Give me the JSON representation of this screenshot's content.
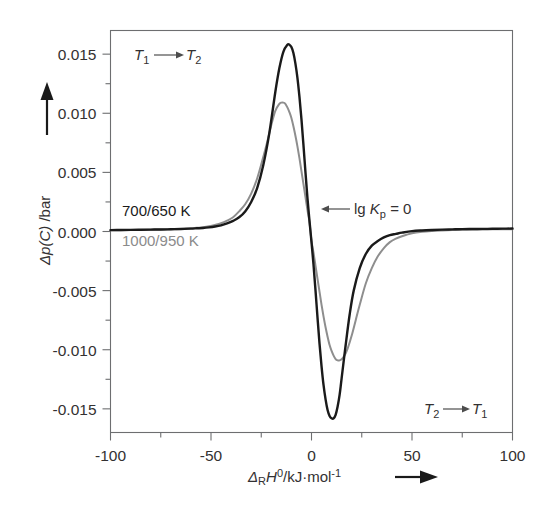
{
  "figure": {
    "background_color": "#ffffff",
    "frame_color": "#6d6e70",
    "text_color": "#333132"
  },
  "axes": {
    "x": {
      "title_parts": {
        "delta": "Δ",
        "sub_r": "R",
        "h": "H",
        "sup_0": "0",
        "units": "/kJ·mol",
        "sup_minus1": "-1"
      },
      "title_plain": "ΔRH0/kJ·mol-1",
      "tick_labels": [
        "-100",
        "-50",
        "0",
        "50",
        "100"
      ],
      "tick_values": [
        -100,
        -50,
        0,
        50,
        100
      ],
      "minor_tick_values": [
        -75,
        -25,
        25,
        75
      ],
      "range": [
        -100,
        100
      ],
      "arrow": "right-arrow"
    },
    "y": {
      "title_parts": {
        "delta_p": "Δp(C)",
        "units": " /bar"
      },
      "title_plain": "Δp(C) /bar",
      "tick_labels": [
        "0.015",
        "0.010",
        "0.005",
        "0.000",
        "-0.005",
        "-0.010",
        "-0.015"
      ],
      "tick_values": [
        0.015,
        0.01,
        0.005,
        0.0,
        -0.005,
        -0.01,
        -0.015
      ],
      "range": [
        -0.017,
        0.017
      ],
      "arrow": "up-arrow"
    }
  },
  "annotations": [
    {
      "id": "transition-forward",
      "text": "T₁ ⟶ T₂",
      "lead": "T",
      "lead_sub": "1",
      "trail": "T",
      "trail_sub": "2",
      "color": "#333132",
      "position": "top-left"
    },
    {
      "id": "series-label-black",
      "text": "700/650 K",
      "color": "#1a1a1a",
      "position": "left-mid"
    },
    {
      "id": "series-label-gray",
      "text": "1000/950 K",
      "color": "#8b8b8b",
      "position": "left-mid-lower"
    },
    {
      "id": "lg-kp-marker",
      "text": "lg Kₚ = 0",
      "lead": "lg ",
      "ital": "K",
      "sub": "p",
      "trail": " = 0",
      "color": "#333132",
      "position": "center-right",
      "arrow": "left-arrow"
    },
    {
      "id": "transition-reverse",
      "text": "T₂ ⟶ T₁",
      "lead": "T",
      "lead_sub": "2",
      "trail": "T",
      "trail_sub": "1",
      "color": "#333132",
      "position": "bottom-right"
    }
  ],
  "chart_data": {
    "type": "line",
    "title": "",
    "subtitle": "",
    "xlabel": "ΔRH⁰/kJ·mol⁻¹",
    "ylabel": "Δp(C)/bar",
    "xlim": [
      -100,
      100
    ],
    "ylim": [
      -0.017,
      0.017
    ],
    "xticks": [
      -100,
      -50,
      0,
      50,
      100
    ],
    "yticks": [
      0.015,
      0.01,
      0.005,
      0.0,
      -0.005,
      -0.01,
      -0.015
    ],
    "grid": false,
    "legend_position": "inside-left",
    "series": [
      {
        "name": "700/650 K",
        "color": "#1a1a1a",
        "peak_x": -11,
        "peak_y": 0.0158,
        "trough_x": 12,
        "trough_y": -0.0155,
        "zero_crossing_x": 0,
        "x": [
          -100,
          -95,
          -90,
          -85,
          -80,
          -75,
          -70,
          -65,
          -60,
          -57,
          -54,
          -51,
          -48,
          -45,
          -42,
          -39,
          -36,
          -33,
          -30,
          -27,
          -24,
          -21,
          -18,
          -16,
          -14,
          -12,
          -11,
          -10,
          -9,
          -8,
          -7,
          -6,
          -5,
          -4,
          -3,
          -2,
          -1,
          0,
          1,
          2,
          3,
          4,
          5,
          6,
          7,
          8,
          9,
          10,
          11,
          12,
          13,
          14,
          15,
          17,
          19,
          21,
          24,
          27,
          30,
          33,
          36,
          39,
          42,
          45,
          50,
          55,
          60,
          65,
          70,
          75,
          80,
          85,
          90,
          95,
          100
        ],
        "y": [
          0.00012,
          0.00013,
          0.00014,
          0.00015,
          0.00016,
          0.00017,
          0.00019,
          0.00021,
          0.00024,
          0.00027,
          0.0003,
          0.00035,
          0.00042,
          0.00052,
          0.00068,
          0.0009,
          0.0012,
          0.0017,
          0.0025,
          0.0037,
          0.0056,
          0.0083,
          0.0118,
          0.0138,
          0.0152,
          0.0158,
          0.0158,
          0.0156,
          0.0151,
          0.0142,
          0.013,
          0.0114,
          0.0095,
          0.0073,
          0.005,
          0.0028,
          0.0009,
          -0.0009,
          -0.0028,
          -0.005,
          -0.0073,
          -0.0095,
          -0.0114,
          -0.013,
          -0.0142,
          -0.0151,
          -0.0156,
          -0.0158,
          -0.0158,
          -0.0155,
          -0.0148,
          -0.0138,
          -0.0124,
          -0.0096,
          -0.007,
          -0.005,
          -0.0031,
          -0.0019,
          -0.0012,
          -0.0008,
          -0.0005,
          -0.0003,
          -0.0002,
          -0.0001,
          3e-05,
          9e-05,
          0.00013,
          0.00016,
          0.00018,
          0.0002,
          0.00021,
          0.00022,
          0.00023,
          0.00024,
          0.00025
        ]
      },
      {
        "name": "1000/950 K",
        "color": "#8e8e8e",
        "peak_x": -14,
        "peak_y": 0.0109,
        "trough_x": 16,
        "trough_y": -0.0109,
        "zero_crossing_x": 0,
        "x": [
          -100,
          -95,
          -90,
          -85,
          -80,
          -75,
          -70,
          -65,
          -60,
          -57,
          -54,
          -51,
          -48,
          -45,
          -42,
          -39,
          -36,
          -33,
          -30,
          -27,
          -24,
          -22,
          -20,
          -18,
          -16,
          -15,
          -14,
          -13,
          -12,
          -11,
          -10,
          -9,
          -8,
          -7,
          -6,
          -5,
          -4,
          -3,
          -2,
          -1,
          0,
          1,
          2,
          3,
          4,
          5,
          6,
          7,
          8,
          9,
          10,
          11,
          12,
          13,
          14,
          15,
          16,
          17,
          18,
          20,
          22,
          24,
          27,
          30,
          33,
          36,
          39,
          42,
          45,
          50,
          55,
          60,
          65,
          70,
          75,
          80,
          85,
          90,
          95,
          100
        ],
        "y": [
          0.0001,
          0.00011,
          0.00012,
          0.00013,
          0.00015,
          0.00017,
          0.00019,
          0.00022,
          0.00027,
          0.00031,
          0.00037,
          0.00045,
          0.00056,
          0.0007,
          0.00092,
          0.0012,
          0.0017,
          0.0023,
          0.0032,
          0.0045,
          0.0063,
          0.0076,
          0.009,
          0.0102,
          0.0108,
          0.0109,
          0.0109,
          0.0108,
          0.0105,
          0.0101,
          0.0096,
          0.0089,
          0.0081,
          0.0072,
          0.0062,
          0.0051,
          0.004,
          0.0029,
          0.0018,
          0.0008,
          -0.0008,
          -0.0018,
          -0.0029,
          -0.004,
          -0.0051,
          -0.0062,
          -0.0072,
          -0.0081,
          -0.0089,
          -0.0096,
          -0.0101,
          -0.0105,
          -0.0108,
          -0.0109,
          -0.0109,
          -0.0108,
          -0.0106,
          -0.0103,
          -0.0099,
          -0.0088,
          -0.0075,
          -0.0062,
          -0.0044,
          -0.0031,
          -0.0021,
          -0.0014,
          -0.0009,
          -0.0006,
          -0.0004,
          -0.00015,
          -2e-05,
          5e-05,
          9e-05,
          0.00012,
          0.00014,
          0.00016,
          0.00017,
          0.00018,
          0.00019,
          0.0002
        ]
      }
    ]
  }
}
